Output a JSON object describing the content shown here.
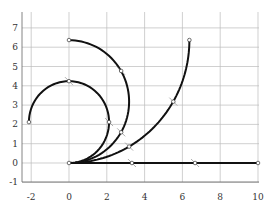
{
  "chart_data": {
    "type": "line",
    "title": "",
    "xlabel": "",
    "ylabel": "",
    "xlim": [
      -2.5,
      10
    ],
    "ylim": [
      -1.5,
      7.8
    ],
    "grid": true,
    "x_ticks": [
      -2,
      0,
      2,
      4,
      6,
      8,
      10
    ],
    "y_ticks": [
      -1,
      0,
      1,
      2,
      3,
      4,
      5,
      6,
      7
    ],
    "x_tick_labels": [
      "-2",
      "0",
      "2",
      "4",
      "6",
      "8",
      "10"
    ],
    "y_tick_labels": [
      "-1",
      "0",
      "1",
      "2",
      "3",
      "4",
      "5",
      "6",
      "7"
    ],
    "series": [
      {
        "name": "straight",
        "description": "curvature 0, length 10",
        "start": [
          0,
          0
        ],
        "end": [
          10,
          0
        ],
        "markers": [
          [
            3.33,
            0
          ],
          [
            6.67,
            0
          ]
        ]
      },
      {
        "name": "quarter-circle",
        "description": "arc radius 6.37, center (0, 6.37), 90 degrees",
        "radius": 6.37,
        "center": [
          0,
          6.37
        ],
        "sweep_deg": 90,
        "start": [
          0,
          0
        ],
        "end": [
          6.37,
          6.37
        ],
        "markers": [
          [
            3.18,
            0.85
          ],
          [
            5.52,
            3.18
          ]
        ]
      },
      {
        "name": "half-circle",
        "description": "arc radius 3.18, center (0, 3.18), 180 degrees",
        "radius": 3.18,
        "center": [
          0,
          3.18
        ],
        "sweep_deg": 180,
        "start": [
          0,
          0
        ],
        "end": [
          0,
          6.37
        ],
        "markers": [
          [
            2.76,
            1.59
          ],
          [
            2.76,
            4.77
          ]
        ]
      },
      {
        "name": "three-quarter-circle",
        "description": "arc radius 2.12, center (0, 2.12), 270 degrees",
        "radius": 2.12,
        "center": [
          0,
          2.12
        ],
        "sweep_deg": 270,
        "start": [
          0,
          0
        ],
        "end": [
          -2.12,
          2.12
        ],
        "markers": [
          [
            2.12,
            2.12
          ],
          [
            0,
            4.24
          ]
        ]
      }
    ],
    "colors": {
      "line": "#111111",
      "grid": "#bbbbbb",
      "frame": "#666666"
    }
  }
}
